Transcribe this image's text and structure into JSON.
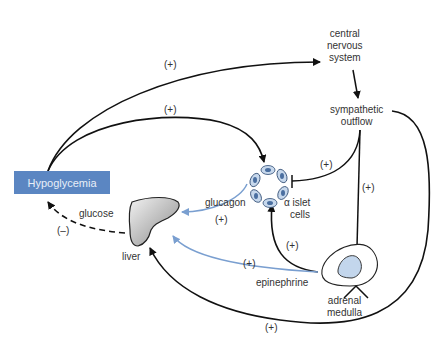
{
  "diagram": {
    "nodes": {
      "hypoglycemia": "Hypoglycemia",
      "cns_line1": "central",
      "cns_line2": "nervous",
      "cns_line3": "system",
      "symp_line1": "sympathetic",
      "symp_line2": "outflow",
      "islet_line1": "α islet",
      "islet_line2": "cells",
      "liver": "liver",
      "adrenal_line1": "adrenal",
      "adrenal_line2": "medulla"
    },
    "edge_labels": {
      "hypo_to_cns": "(+)",
      "hypo_to_islet": "(+)",
      "symp_to_islet": "(+)",
      "symp_to_adrenal": "(+)",
      "adrenal_to_islet": "(+)",
      "glucagon": "glucagon",
      "glucagon_sign": "(+)",
      "epinephrine": "epinephrine",
      "epinephrine_sign": "(+)",
      "glucose": "glucose",
      "glucose_sign": "(–)",
      "symp_to_liver": "(+)"
    },
    "colors": {
      "box": "#5b86c2",
      "hormone_arrow": "#7a9fd0",
      "line": "#111111"
    }
  }
}
